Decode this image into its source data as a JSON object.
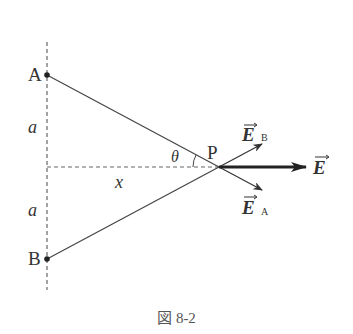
{
  "figure": {
    "caption": "図 8-2",
    "points": {
      "A": {
        "label": "A",
        "x": 47,
        "y": 75
      },
      "B": {
        "label": "B",
        "x": 47,
        "y": 259
      },
      "P": {
        "label": "P",
        "x": 219,
        "y": 167
      }
    },
    "distance_labels": {
      "upper_a": "a",
      "lower_a": "a",
      "x": "x"
    },
    "angle_label": "θ",
    "vectors": {
      "E_B": {
        "symbol": "E",
        "subscript": "B"
      },
      "E_A": {
        "symbol": "E",
        "subscript": "A"
      },
      "E": {
        "symbol": "E"
      }
    },
    "colors": {
      "line": "#444444",
      "dashed": "#666666",
      "text": "#333333"
    }
  }
}
